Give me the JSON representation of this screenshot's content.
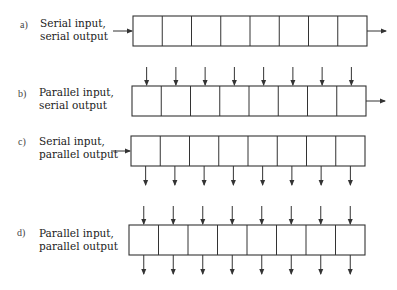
{
  "figure": {
    "cells_per_register": 8,
    "stroke_color": "#333333",
    "registers": [
      {
        "id": "a",
        "tag": "a)",
        "line1": "Serial input,",
        "line2": "serial output",
        "serial_in": true,
        "serial_out": true,
        "parallel_in": false,
        "parallel_out": false,
        "x": 133,
        "y": 16,
        "w": 234,
        "h": 30,
        "label_y": 19
      },
      {
        "id": "b",
        "tag": "b)",
        "line1": "Parallel input,",
        "line2": "serial output",
        "serial_in": false,
        "serial_out": true,
        "parallel_in": true,
        "parallel_out": false,
        "x": 132,
        "y": 86,
        "w": 234,
        "h": 30,
        "label_y": 88
      },
      {
        "id": "c",
        "tag": "c)",
        "line1": "Serial input,",
        "line2": "parallel output",
        "serial_in": true,
        "serial_out": false,
        "parallel_in": false,
        "parallel_out": true,
        "x": 131,
        "y": 136,
        "w": 234,
        "h": 30,
        "label_y": 137
      },
      {
        "id": "d",
        "tag": "d)",
        "line1": "Parallel input,",
        "line2": "parallel output",
        "serial_in": false,
        "serial_out": false,
        "parallel_in": true,
        "parallel_out": true,
        "x": 129,
        "y": 225,
        "w": 236,
        "h": 30,
        "label_y": 227
      }
    ]
  }
}
